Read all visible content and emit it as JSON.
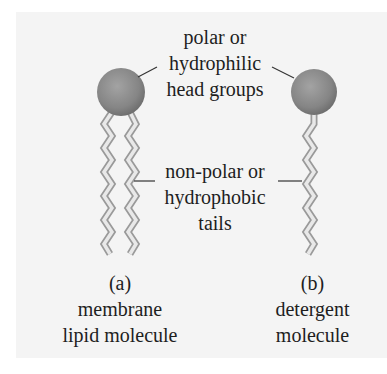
{
  "figure": {
    "head_label": {
      "lines": [
        "polar or",
        "hydrophilic",
        "head groups"
      ]
    },
    "tail_label": {
      "lines": [
        "non-polar or",
        "hydrophobic",
        "tails"
      ]
    },
    "captions": [
      {
        "id": "a",
        "letter": "(a)",
        "lines": [
          "membrane",
          "lipid molecule"
        ]
      },
      {
        "id": "b",
        "letter": "(b)",
        "lines": [
          "detergent",
          "molecule"
        ]
      }
    ],
    "colors": {
      "background": "#f4f4f4",
      "head_fill": "#8a8a8a",
      "tail_fill": "#e6e6e6",
      "tail_stroke": "#9a9a9a",
      "leader_line": "#333333",
      "text": "#1e1e1e"
    }
  }
}
